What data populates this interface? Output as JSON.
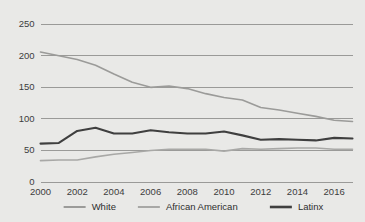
{
  "chart_data": {
    "type": "line",
    "title": "",
    "xlabel": "",
    "ylabel": "",
    "ylim": [
      0,
      250
    ],
    "xlim": [
      2000,
      2017
    ],
    "grid": true,
    "legend_position": "bottom",
    "y_ticks": [
      "0",
      "50",
      "100",
      "150",
      "200",
      "250"
    ],
    "y_tick_values": [
      0,
      50,
      100,
      150,
      200,
      250
    ],
    "x_ticks": [
      "2000",
      "2002",
      "2004",
      "2006",
      "2008",
      "2010",
      "2012",
      "2014",
      "2016"
    ],
    "x_tick_values": [
      2000,
      2002,
      2004,
      2006,
      2008,
      2010,
      2012,
      2014,
      2016
    ],
    "x": [
      2000,
      2001,
      2002,
      2003,
      2004,
      2005,
      2006,
      2007,
      2008,
      2009,
      2010,
      2011,
      2012,
      2013,
      2014,
      2015,
      2016,
      2017
    ],
    "series": [
      {
        "name": "White",
        "color": "#9b9b99",
        "values": [
          205,
          199,
          193,
          184,
          170,
          157,
          149,
          151,
          147,
          139,
          133,
          129,
          117,
          113,
          108,
          103,
          97,
          95
        ]
      },
      {
        "name": "African American",
        "color": "#a8a8a6",
        "values": [
          33,
          34,
          34,
          39,
          43,
          46,
          49,
          51,
          51,
          51,
          48,
          52,
          51,
          52,
          53,
          53,
          51,
          51
        ]
      },
      {
        "name": "Latinx",
        "color": "#3f3f3f",
        "values": [
          60,
          61,
          80,
          85,
          76,
          76,
          81,
          78,
          76,
          76,
          79,
          73,
          66,
          67,
          66,
          65,
          69,
          68
        ]
      }
    ]
  },
  "legend": {
    "items": [
      {
        "label": "White",
        "color": "#9b9b99"
      },
      {
        "label": "African American",
        "color": "#a8a8a6"
      },
      {
        "label": "Latinx",
        "color": "#3f3f3f"
      }
    ]
  },
  "colors": {
    "background": "#e9e9e7",
    "grid": "#9a9a98",
    "text": "#3d3d3d"
  }
}
